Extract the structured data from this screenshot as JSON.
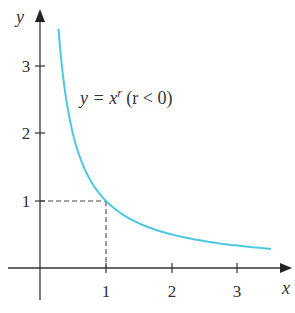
{
  "chart_data": {
    "type": "line",
    "title": "",
    "xlabel": "x",
    "ylabel": "y",
    "xlim": [
      -0.4,
      3.85
    ],
    "ylim": [
      -0.5,
      3.85
    ],
    "grid": false,
    "legend": null,
    "x_ticks": [
      1,
      2,
      3
    ],
    "x_tick_labels": [
      "1",
      "2",
      "3"
    ],
    "y_ticks": [
      1,
      2,
      3
    ],
    "y_tick_labels": [
      "1",
      "2",
      "3"
    ],
    "series": [
      {
        "name": "y = x^r (r < 0)",
        "color": "#4cc9e0",
        "function": "1/x",
        "x": [
          0.28,
          0.35,
          0.45,
          0.6,
          0.8,
          1.0,
          1.25,
          1.5,
          2.0,
          2.5,
          3.0,
          3.5
        ],
        "y": [
          3.57,
          2.86,
          2.22,
          1.67,
          1.25,
          1.0,
          0.8,
          0.67,
          0.5,
          0.4,
          0.33,
          0.29
        ]
      }
    ],
    "annotations": [
      {
        "text_main": "y = x",
        "superscript": "r",
        "text_suffix": " (r < 0)",
        "x": 0.6,
        "y": 2.6
      }
    ],
    "reference_lines": [
      {
        "type": "dashed",
        "from": [
          0,
          1
        ],
        "to": [
          1,
          1
        ]
      },
      {
        "type": "dashed",
        "from": [
          1,
          1
        ],
        "to": [
          1,
          0
        ]
      }
    ],
    "highlight_point": {
      "x": 1,
      "y": 1
    }
  },
  "labels": {
    "x_axis": "x",
    "y_axis": "y",
    "x_tick_1": "1",
    "x_tick_2": "2",
    "x_tick_3": "3",
    "y_tick_1": "1",
    "y_tick_2": "2",
    "y_tick_3": "3",
    "equation_main": "y = x",
    "equation_sup": "r",
    "equation_suffix": " (r < 0)"
  },
  "colors": {
    "curve": "#4cc9e0",
    "axis": "#333333",
    "dashed": "#444444"
  }
}
